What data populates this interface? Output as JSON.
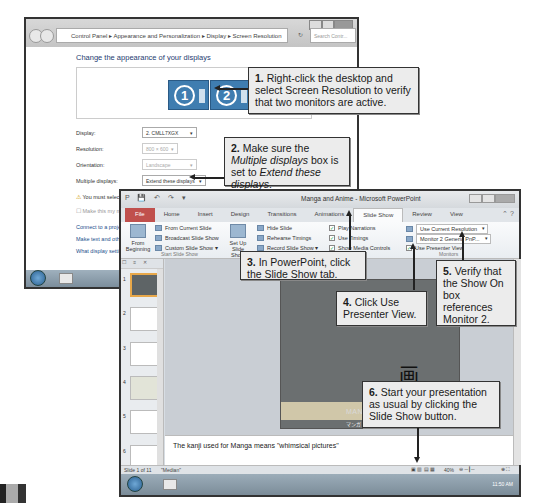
{
  "control_panel": {
    "breadcrumb": [
      "Control Panel",
      "Appearance and Personalization",
      "Display",
      "Screen Resolution"
    ],
    "search_placeholder": "Search Contr...",
    "heading": "Change the appearance of your displays",
    "monitors": [
      "1",
      "2"
    ],
    "fields": [
      {
        "label": "Display:",
        "value": "2. CMLL7XGX"
      },
      {
        "label": "Resolution:",
        "value": "800 × 600"
      },
      {
        "label": "Orientation:",
        "value": "Landscape"
      },
      {
        "label": "Multiple displays:",
        "value": "Extend these displays"
      }
    ],
    "warning": "You must select Ap...",
    "checkbox_label": "Make this my main d...",
    "links": [
      "Connect to a projector (...",
      "Make text and other ite...",
      "What display settings sh..."
    ]
  },
  "powerpoint": {
    "title": "Manga and Anime - Microsoft PowerPoint",
    "tabs": [
      "File",
      "Home",
      "Insert",
      "Design",
      "Transitions",
      "Animations",
      "Slide Show",
      "Review",
      "View"
    ],
    "active_tab": "Slide Show",
    "ribbon": {
      "from_beginning": "From Beginning",
      "from_current": "From Current Slide",
      "broadcast": "Broadcast Slide Show",
      "custom": "Custom Slide Show",
      "start_group": "Start Slide Show",
      "setup": "Set Up Slide Show",
      "hide_slide": "Hide Slide",
      "rehearse": "Rehearse Timings",
      "record": "Record Slide Show",
      "play_narrations": "Play Narrations",
      "use_timings": "Use Timings",
      "show_media": "Show Media Controls",
      "resolution": "Use Current Resolution",
      "show_on": "Monitor 2 Generic PnP...",
      "presenter_view": "Use Presenter View",
      "monitors_group": "Monitors"
    },
    "thumbnails": [
      "1",
      "2",
      "3",
      "4",
      "5",
      "6"
    ],
    "slide": {
      "kanji": "画",
      "title": "MANGA AN...",
      "subtitle": "マンガ"
    },
    "notes": "The kanji used for Manga means \"whimsical pictures\"",
    "status": {
      "slide": "Slide 1 of 11",
      "theme": "\"Median\"",
      "zoom": "40%"
    },
    "clock": "11:50 AM"
  },
  "callouts": [
    {
      "num": "1.",
      "text": "Right-click the desktop and select Screen Resolution to verify that two monitors are active."
    },
    {
      "num": "2.",
      "pre": "Make sure the ",
      "em1": "Multiple displays",
      "mid": " box is set to ",
      "em2": "Extend these displays",
      "post": "."
    },
    {
      "num": "3.",
      "text": "In PowerPoint, click the Slide Show tab."
    },
    {
      "num": "4.",
      "text": "Click Use Presenter View."
    },
    {
      "num": "5.",
      "text": "Verify that the Show On box references Monitor 2."
    },
    {
      "num": "6.",
      "text": "Start your presentation as usual by clicking the Slide Show button."
    }
  ]
}
